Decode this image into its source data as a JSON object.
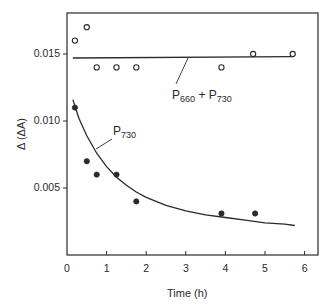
{
  "chart_data": {
    "type": "scatter",
    "title": "",
    "xlabel": "Time (h)",
    "ylabel": "Δ (ΔA)",
    "xlim": [
      0,
      6.3
    ],
    "ylim": [
      0,
      0.0182
    ],
    "grid": false,
    "legend": "none (inline annotations)",
    "x_ticks": [
      "0",
      "1",
      "2",
      "3",
      "4",
      "5",
      "6"
    ],
    "y_ticks": [
      "0.005",
      "0.010",
      "0.015"
    ],
    "series": [
      {
        "name": "P660 + P730",
        "marker": "open-circle",
        "x": [
          0.2,
          0.5,
          0.75,
          1.25,
          1.75,
          3.9,
          4.7,
          5.7
        ],
        "y": [
          0.016,
          0.017,
          0.014,
          0.014,
          0.014,
          0.014,
          0.015,
          0.015
        ]
      },
      {
        "name": "P730",
        "marker": "filled-circle",
        "x": [
          0.2,
          0.5,
          0.75,
          1.25,
          1.75,
          3.9,
          4.75
        ],
        "y": [
          0.011,
          0.007,
          0.006,
          0.006,
          0.004,
          0.0031,
          0.0031
        ]
      }
    ],
    "fit_lines": [
      {
        "name": "P660 + P730 fit",
        "type": "horizontal",
        "x": [
          0.15,
          5.7
        ],
        "y": [
          0.0147,
          0.0148
        ]
      },
      {
        "name": "P730 fit",
        "type": "exponential-decay",
        "x": [
          0.15,
          0.3,
          0.5,
          0.75,
          1.0,
          1.25,
          1.5,
          1.75,
          2.0,
          2.5,
          3.0,
          3.5,
          4.0,
          4.5,
          5.0,
          5.5,
          5.75
        ],
        "y": [
          0.0116,
          0.0102,
          0.0089,
          0.0076,
          0.0066,
          0.0058,
          0.0052,
          0.0047,
          0.0043,
          0.0037,
          0.0033,
          0.003,
          0.0028,
          0.0026,
          0.0024,
          0.0023,
          0.0022
        ]
      }
    ],
    "annotations": [
      {
        "text_main": "P",
        "text_sub": "730",
        "near": [
          1.2,
          0.0085
        ]
      },
      {
        "text_main": "P",
        "text_sub": "660",
        "plus": " + ",
        "text_main2": "P",
        "text_sub2": "730",
        "near": [
          3.0,
          0.0122
        ]
      }
    ]
  },
  "labels": {
    "ylabel": "Δ (ΔA)",
    "xlabel": "Time (h)",
    "yticks": [
      "0.005",
      "0.010",
      "0.015"
    ],
    "xticks": [
      "0",
      "1",
      "2",
      "3",
      "4",
      "5",
      "6"
    ],
    "p730": {
      "main": "P",
      "sub": "730"
    },
    "p660p730": {
      "main1": "P",
      "sub1": "660",
      "plus": " + ",
      "main2": "P",
      "sub2": "730"
    }
  },
  "colors": {
    "ink": "#2a2a2a",
    "background": "#ffffff"
  }
}
